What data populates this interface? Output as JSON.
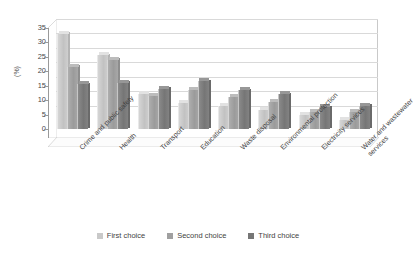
{
  "chart_data": {
    "type": "bar",
    "title": "",
    "xlabel": "",
    "ylabel": "(%)",
    "ylim": [
      0,
      35
    ],
    "yticks": [
      0,
      5,
      10,
      15,
      20,
      25,
      30,
      35
    ],
    "grid": true,
    "legend_position": "bottom",
    "style": "3d-clustered-column",
    "categories": [
      "Crime and public safety",
      "Health",
      "Transport",
      "Education",
      "Waste disposal",
      "Environmental protection",
      "Electricity services",
      "Water and wastewater services"
    ],
    "series": [
      {
        "name": "First choice",
        "color": "#c9c9c9",
        "values": [
          33,
          25.5,
          12,
          9,
          8,
          6.5,
          5,
          3
        ]
      },
      {
        "name": "Second choice",
        "color": "#a0a0a0",
        "values": [
          21.5,
          24,
          11.5,
          13.5,
          11,
          9.5,
          6,
          6
        ]
      },
      {
        "name": "Third choice",
        "color": "#767676",
        "values": [
          15.5,
          16,
          14,
          16.5,
          13.5,
          12,
          7.5,
          8
        ]
      }
    ]
  },
  "axis": {
    "y_title": "(%)",
    "y_tick_labels": [
      "35",
      "30",
      "25",
      "20",
      "15",
      "10",
      "5",
      "0"
    ]
  },
  "legend": {
    "items": [
      {
        "label": "First choice"
      },
      {
        "label": "Second choice"
      },
      {
        "label": "Third choice"
      }
    ]
  }
}
